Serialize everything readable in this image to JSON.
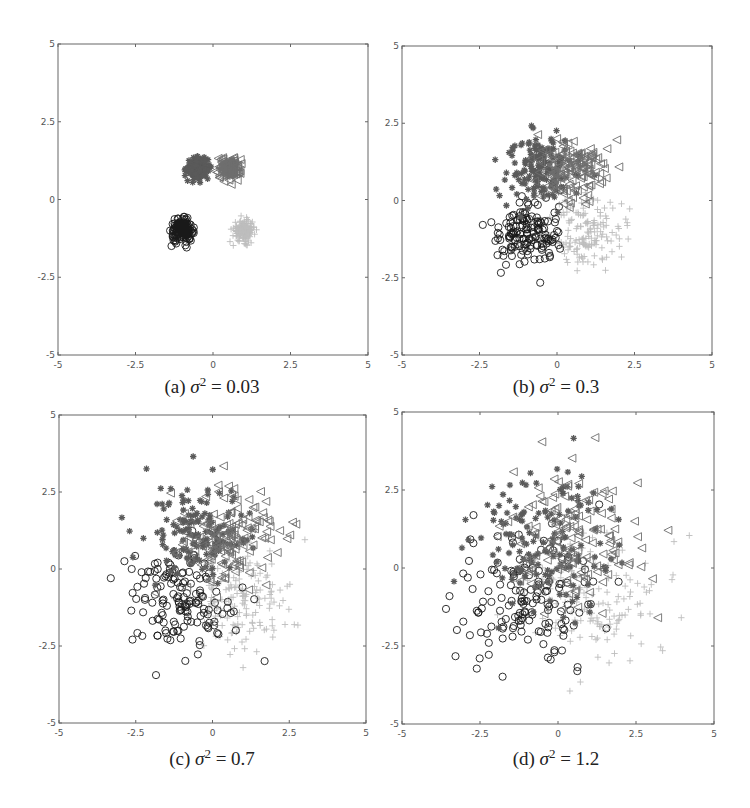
{
  "chart_data": [
    {
      "type": "scatter",
      "panel": "a",
      "caption_prefix": "(a)",
      "caption_symbol": "σ",
      "caption_exp": "2",
      "caption_value": "= 0.03",
      "variance": 0.03,
      "xlim": [
        -5,
        5
      ],
      "ylim": [
        -5,
        5
      ],
      "xticks": [
        "-5",
        "-2.5",
        "0",
        "2.5",
        "5"
      ],
      "yticks": [
        "-5",
        "-2.5",
        "0",
        "2.5",
        "5"
      ],
      "grid": false,
      "points_per_class": 150,
      "series": [
        {
          "name": "class-1",
          "marker": "star",
          "color": "#5a5a5a",
          "center": [
            -0.5,
            1.0
          ]
        },
        {
          "name": "class-2",
          "marker": "triangle-left",
          "color": "#6e6e6e",
          "center": [
            0.5,
            1.0
          ]
        },
        {
          "name": "class-3",
          "marker": "circle",
          "color": "#1a1a1a",
          "center": [
            -1.0,
            -1.0
          ]
        },
        {
          "name": "class-4",
          "marker": "plus",
          "color": "#bdbdbd",
          "center": [
            1.0,
            -1.0
          ]
        }
      ]
    },
    {
      "type": "scatter",
      "panel": "b",
      "caption_prefix": "(b)",
      "caption_symbol": "σ",
      "caption_exp": "2",
      "caption_value": "= 0.3",
      "variance": 0.3,
      "xlim": [
        -5,
        5
      ],
      "ylim": [
        -5,
        5
      ],
      "xticks": [
        "-5",
        "-2.5",
        "0",
        "2.5",
        "5"
      ],
      "yticks": [
        "-5",
        "-2.5",
        "0",
        "2.5",
        "5"
      ],
      "grid": false,
      "points_per_class": 150,
      "series": [
        {
          "name": "class-1",
          "marker": "star",
          "color": "#5a5a5a",
          "center": [
            -0.5,
            1.0
          ]
        },
        {
          "name": "class-2",
          "marker": "triangle-left",
          "color": "#6e6e6e",
          "center": [
            0.5,
            1.0
          ]
        },
        {
          "name": "class-3",
          "marker": "circle",
          "color": "#1a1a1a",
          "center": [
            -1.0,
            -1.0
          ]
        },
        {
          "name": "class-4",
          "marker": "plus",
          "color": "#bdbdbd",
          "center": [
            1.0,
            -1.0
          ]
        }
      ]
    },
    {
      "type": "scatter",
      "panel": "c",
      "caption_prefix": "(c)",
      "caption_symbol": "σ",
      "caption_exp": "2",
      "caption_value": "= 0.7",
      "variance": 0.7,
      "xlim": [
        -5,
        5
      ],
      "ylim": [
        -5,
        5
      ],
      "xticks": [
        "-5",
        "-2.5",
        "0",
        "2.5",
        "5"
      ],
      "yticks": [
        "-5",
        "-2.5",
        "0",
        "2.5",
        "5"
      ],
      "grid": false,
      "points_per_class": 150,
      "series": [
        {
          "name": "class-1",
          "marker": "star",
          "color": "#5a5a5a",
          "center": [
            -0.5,
            1.0
          ]
        },
        {
          "name": "class-2",
          "marker": "triangle-left",
          "color": "#6e6e6e",
          "center": [
            0.5,
            1.0
          ]
        },
        {
          "name": "class-3",
          "marker": "circle",
          "color": "#1a1a1a",
          "center": [
            -1.0,
            -1.0
          ]
        },
        {
          "name": "class-4",
          "marker": "plus",
          "color": "#bdbdbd",
          "center": [
            1.0,
            -1.0
          ]
        }
      ]
    },
    {
      "type": "scatter",
      "panel": "d",
      "caption_prefix": "(d)",
      "caption_symbol": "σ",
      "caption_exp": "2",
      "caption_value": "= 1.2",
      "variance": 1.2,
      "xlim": [
        -5,
        5
      ],
      "ylim": [
        -5,
        5
      ],
      "xticks": [
        "-5",
        "-2.5",
        "0",
        "2.5",
        "5"
      ],
      "yticks": [
        "-5",
        "-2.5",
        "0",
        "2.5",
        "5"
      ],
      "grid": false,
      "points_per_class": 150,
      "series": [
        {
          "name": "class-1",
          "marker": "star",
          "color": "#5a5a5a",
          "center": [
            -0.5,
            1.0
          ]
        },
        {
          "name": "class-2",
          "marker": "triangle-left",
          "color": "#6e6e6e",
          "center": [
            0.5,
            1.0
          ]
        },
        {
          "name": "class-3",
          "marker": "circle",
          "color": "#1a1a1a",
          "center": [
            -1.0,
            -1.0
          ]
        },
        {
          "name": "class-4",
          "marker": "plus",
          "color": "#bdbdbd",
          "center": [
            1.0,
            -1.0
          ]
        }
      ]
    }
  ]
}
